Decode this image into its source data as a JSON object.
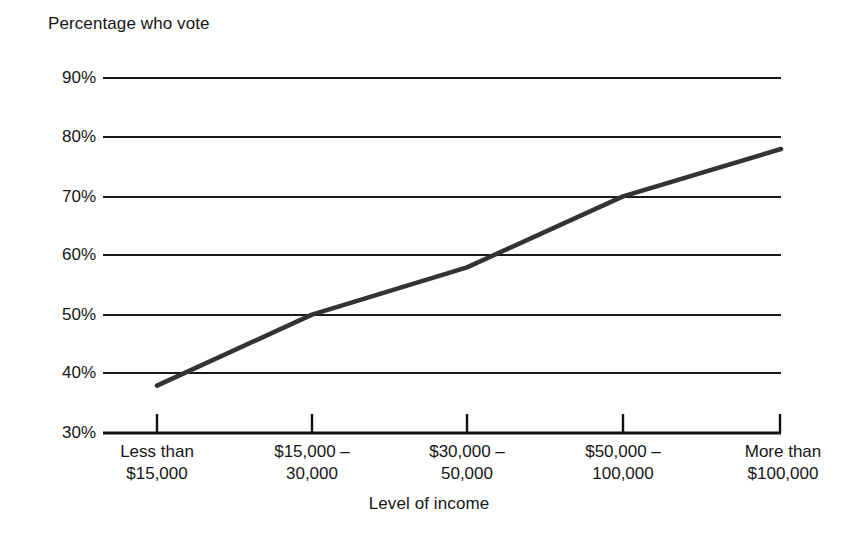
{
  "chart_data": {
    "type": "line",
    "title": "",
    "ylabel": "Percentage who vote",
    "xlabel": "Level of income",
    "categories": [
      "Less than $15,000",
      "$15,000 – 30,000",
      "$30,000 – 50,000",
      "$50,000 – 100,000",
      "More than $100,000"
    ],
    "category_lines": [
      [
        "Less than",
        "$15,000"
      ],
      [
        "$15,000 –",
        "30,000"
      ],
      [
        "$30,000 –",
        "50,000"
      ],
      [
        "$50,000 –",
        "100,000"
      ],
      [
        "More than",
        "$100,000"
      ]
    ],
    "values": [
      38,
      50,
      58,
      70,
      78
    ],
    "ylim": [
      30,
      90
    ],
    "yticks": [
      30,
      40,
      50,
      60,
      70,
      80,
      90
    ],
    "ytick_labels": [
      "30%",
      "40%",
      "50%",
      "60%",
      "70%",
      "80%",
      "90%"
    ],
    "grid": true,
    "grid_axis": "y",
    "legend": "none",
    "series": [
      {
        "name": "Percentage who vote",
        "values": [
          38,
          50,
          58,
          70,
          78
        ],
        "color": "#333333",
        "line_width": 4.5
      }
    ]
  },
  "colors": {
    "background": "#ffffff",
    "text": "#161616",
    "grid": "#1a1a1a",
    "axis": "#111111",
    "series": "#333333"
  }
}
